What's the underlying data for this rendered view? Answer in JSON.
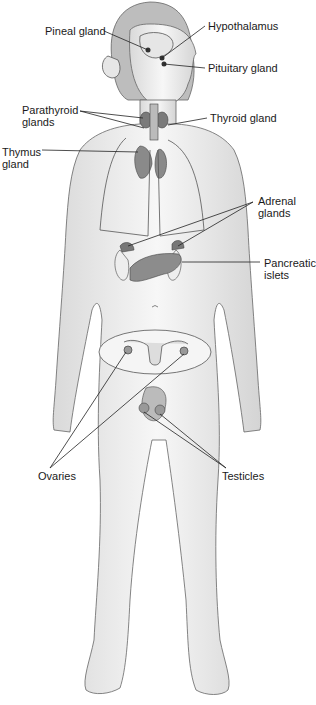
{
  "diagram": {
    "colors": {
      "background": "#ffffff",
      "skin": "#f2f2f2",
      "outline": "#555555",
      "gland": "#8a8a8a",
      "text": "#1a1a1a"
    },
    "labels": {
      "pineal": {
        "line1": "Pineal gland"
      },
      "hypothalamus": {
        "line1": "Hypothalamus"
      },
      "pituitary": {
        "line1": "Pituitary gland"
      },
      "parathyroid": {
        "line1": "Parathyroid",
        "line2": "glands"
      },
      "thyroid": {
        "line1": "Thyroid gland"
      },
      "thymus": {
        "line1": "Thymus",
        "line2": "gland"
      },
      "adrenal": {
        "line1": "Adrenal",
        "line2": "glands"
      },
      "pancreas": {
        "line1": "Pancreatic",
        "line2": "islets"
      },
      "ovaries": {
        "line1": "Ovaries"
      },
      "testicles": {
        "line1": "Testicles"
      }
    }
  }
}
